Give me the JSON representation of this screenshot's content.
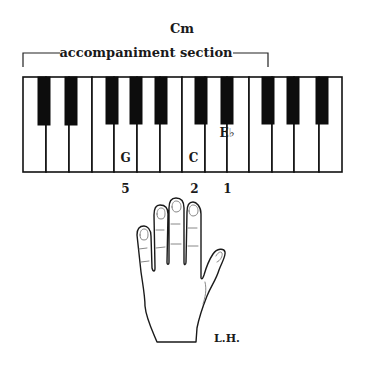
{
  "chord": {
    "name": "Cm"
  },
  "section_label": "accompaniment section",
  "keyboard": {
    "white_key_count": 14,
    "white_keys": [
      "C",
      "D",
      "E",
      "F",
      "G",
      "A",
      "B",
      "C",
      "D",
      "E",
      "F",
      "G",
      "A",
      "B"
    ],
    "black_keys": [
      "C#",
      "D#",
      "F#",
      "G#",
      "A#",
      "C#",
      "D#",
      "F#",
      "G#",
      "A#"
    ],
    "marked_notes": [
      {
        "label": "G",
        "key_type": "white",
        "finger": "5"
      },
      {
        "label": "C",
        "key_type": "white",
        "finger": "2"
      },
      {
        "label": "E♭",
        "key_type": "black",
        "finger": "1"
      }
    ]
  },
  "fingering": {
    "g_finger": "5",
    "c_finger": "2",
    "eb_finger": "1"
  },
  "notes": {
    "g": "G",
    "c": "C",
    "eb": "E♭"
  },
  "hand": {
    "label": "L.H."
  },
  "colors": {
    "ink": "#111111",
    "paper": "#ffffff"
  }
}
